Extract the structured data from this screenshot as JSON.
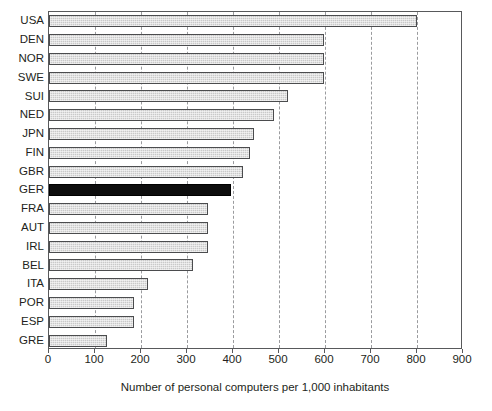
{
  "chart_data": {
    "type": "bar",
    "orientation": "horizontal",
    "title": "",
    "xlabel": "Number of personal computers per 1,000 inhabitants",
    "ylabel": "",
    "xlim": [
      0,
      900
    ],
    "xticks": [
      0,
      100,
      200,
      300,
      400,
      500,
      600,
      700,
      800,
      900
    ],
    "xtick_labels": [
      "0",
      "100",
      "200",
      "300",
      "400",
      "500",
      "600",
      "700",
      "800",
      "900"
    ],
    "grid": "vertical-dashed",
    "legend": "none",
    "categories": [
      "USA",
      "DEN",
      "NOR",
      "SWE",
      "SUI",
      "NED",
      "JPN",
      "FIN",
      "GBR",
      "GER",
      "FRA",
      "AUT",
      "IRL",
      "BEL",
      "ITA",
      "POR",
      "ESP",
      "GRE"
    ],
    "values": [
      800,
      597,
      597,
      597,
      520,
      490,
      445,
      437,
      422,
      396,
      345,
      345,
      345,
      312,
      215,
      184,
      184,
      125
    ],
    "highlight_category": "GER",
    "colors": {
      "bar_fill": "#c9c9c9",
      "bar_edge": "#4b4c4e",
      "highlight_fill": "#0d0d0d",
      "highlight_edge": "#000000",
      "grid": "#9a9b9e",
      "axis": "#58595b",
      "text": "#231f20"
    }
  },
  "caption_stub": ""
}
